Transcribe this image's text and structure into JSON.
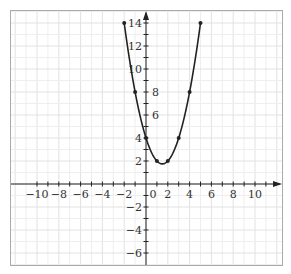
{
  "chart_data": {
    "type": "line",
    "title": "",
    "xlabel": "",
    "ylabel": "",
    "function": "y = x^2 - 3x + 4",
    "xlim": [
      -11.5,
      12.5
    ],
    "ylim": [
      -7,
      15
    ],
    "grid": true,
    "x_ticks": [
      -10,
      -8,
      -6,
      -4,
      -2,
      0,
      2,
      4,
      6,
      8,
      10
    ],
    "y_ticks": [
      -6,
      -4,
      -2,
      2,
      4,
      6,
      8,
      10,
      12,
      14
    ],
    "x_tick_labels": [
      "−10",
      "−8",
      "−6",
      "−4",
      "−2",
      "0",
      "2",
      "4",
      "6",
      "8",
      "10"
    ],
    "y_tick_labels": [
      "−6",
      "−4",
      "−2",
      "2",
      "4",
      "6",
      "8",
      "10",
      "12",
      "14"
    ],
    "series": [
      {
        "name": "parabola",
        "x": [
          -2,
          -1,
          0,
          1,
          2,
          3,
          4,
          5
        ],
        "y": [
          14,
          8,
          4,
          2,
          2,
          4,
          8,
          14
        ],
        "vertex": [
          1.5,
          1.75
        ],
        "color": "#222222",
        "markers": true
      }
    ]
  },
  "colors": {
    "grid_minor": "#eeeeee",
    "grid_major": "#e2e2e2",
    "axis": "#222222",
    "border": "#aaaaaa",
    "curve": "#222222"
  }
}
